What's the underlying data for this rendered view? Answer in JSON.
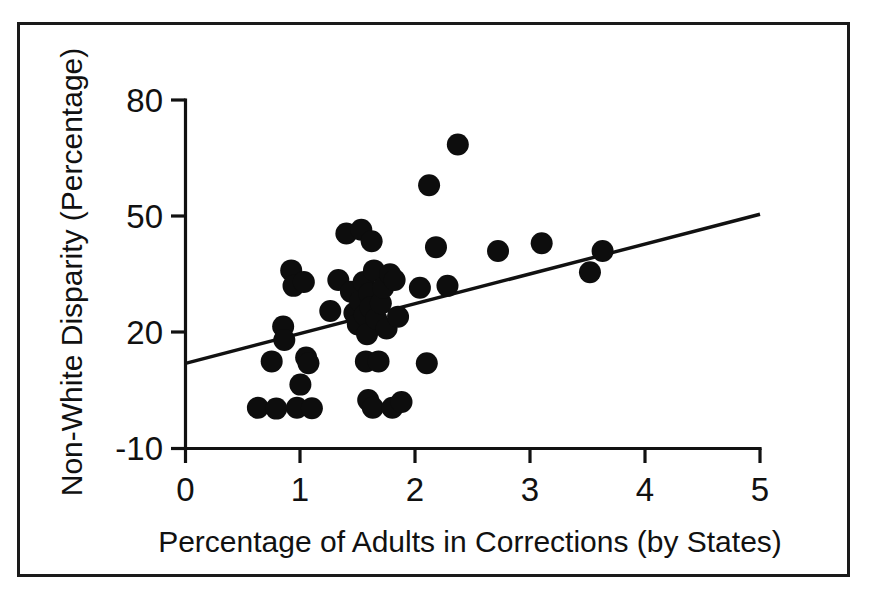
{
  "figure": {
    "frame_color": "#1a1a1a",
    "background": "#ffffff",
    "marker_color": "#0d0d0d",
    "line_color": "#111111"
  },
  "chart_data": {
    "type": "scatter",
    "title": "",
    "xlabel": "Percentage of Adults in Corrections (by States)",
    "ylabel": "Non-White Disparity (Percentage)",
    "xlim": [
      0,
      5
    ],
    "ylim": [
      -10,
      80
    ],
    "xticks": [
      0,
      1,
      2,
      3,
      4,
      5
    ],
    "xticklabels": [
      "0",
      "1",
      "2",
      "3",
      "4",
      "5"
    ],
    "yticks": [
      -10,
      20,
      50,
      80
    ],
    "yticklabels": [
      "-10",
      "20",
      "50",
      "80"
    ],
    "grid": false,
    "legend": null,
    "marker_size_px": 11,
    "points": [
      {
        "x": 0.63,
        "y": 0.5
      },
      {
        "x": 0.75,
        "y": 12.5
      },
      {
        "x": 0.79,
        "y": 0.3
      },
      {
        "x": 0.85,
        "y": 21.5
      },
      {
        "x": 0.86,
        "y": 18.0
      },
      {
        "x": 0.92,
        "y": 36.0
      },
      {
        "x": 0.94,
        "y": 32.0
      },
      {
        "x": 0.97,
        "y": 0.5
      },
      {
        "x": 1.0,
        "y": 6.5
      },
      {
        "x": 1.03,
        "y": 33.0
      },
      {
        "x": 1.05,
        "y": 13.5
      },
      {
        "x": 1.07,
        "y": 12.0
      },
      {
        "x": 1.1,
        "y": 0.4
      },
      {
        "x": 1.26,
        "y": 25.5
      },
      {
        "x": 1.33,
        "y": 33.5
      },
      {
        "x": 1.4,
        "y": 45.5
      },
      {
        "x": 1.44,
        "y": 30.5
      },
      {
        "x": 1.47,
        "y": 25.0
      },
      {
        "x": 1.5,
        "y": 22.0
      },
      {
        "x": 1.52,
        "y": 28.0
      },
      {
        "x": 1.53,
        "y": 46.5
      },
      {
        "x": 1.55,
        "y": 33.0
      },
      {
        "x": 1.56,
        "y": 24.5
      },
      {
        "x": 1.57,
        "y": 12.5
      },
      {
        "x": 1.58,
        "y": 19.5
      },
      {
        "x": 1.59,
        "y": 2.5
      },
      {
        "x": 1.6,
        "y": 30.0
      },
      {
        "x": 1.61,
        "y": 26.5
      },
      {
        "x": 1.62,
        "y": 43.5
      },
      {
        "x": 1.63,
        "y": 0.5
      },
      {
        "x": 1.64,
        "y": 36.0
      },
      {
        "x": 1.66,
        "y": 23.5
      },
      {
        "x": 1.68,
        "y": 12.5
      },
      {
        "x": 1.7,
        "y": 27.5
      },
      {
        "x": 1.72,
        "y": 31.5
      },
      {
        "x": 1.75,
        "y": 21.0
      },
      {
        "x": 1.78,
        "y": 35.0
      },
      {
        "x": 1.8,
        "y": 0.5
      },
      {
        "x": 1.82,
        "y": 33.5
      },
      {
        "x": 1.85,
        "y": 24.0
      },
      {
        "x": 1.88,
        "y": 2.0
      },
      {
        "x": 2.04,
        "y": 31.5
      },
      {
        "x": 2.1,
        "y": 12.0
      },
      {
        "x": 2.12,
        "y": 58.0
      },
      {
        "x": 2.18,
        "y": 42.0
      },
      {
        "x": 2.28,
        "y": 32.0
      },
      {
        "x": 2.37,
        "y": 68.5
      },
      {
        "x": 2.72,
        "y": 41.0
      },
      {
        "x": 3.1,
        "y": 43.0
      },
      {
        "x": 3.52,
        "y": 35.5
      },
      {
        "x": 3.63,
        "y": 41.0
      }
    ],
    "trend_line": {
      "x_start": 0.0,
      "y_start": 12.0,
      "x_end": 5.0,
      "y_end": 50.5,
      "label": "fit-line"
    }
  }
}
